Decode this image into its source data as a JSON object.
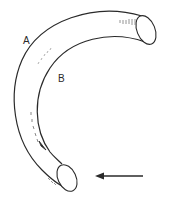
{
  "diagram": {
    "labels": {
      "outer_wall": "A",
      "inner_wall": "B"
    },
    "colors": {
      "stroke": "#2a2a2a",
      "background": "#ffffff",
      "hatch": "#7a7a7a"
    },
    "icons": {
      "flow_arrow": "left-arrow",
      "surface_flow_arrow": "arrowhead"
    }
  }
}
